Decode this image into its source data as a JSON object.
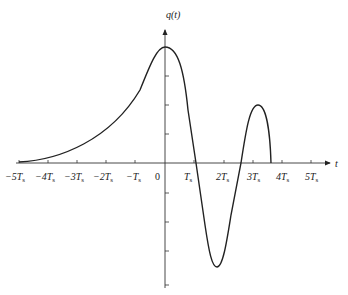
{
  "diagram": {
    "y_label": "q(t)",
    "x_label": "t",
    "x_ticks": [
      {
        "sign": "−",
        "coef": "5",
        "sym": "T",
        "sub": "s",
        "x": 19
      },
      {
        "sign": "−",
        "coef": "4",
        "sym": "T",
        "sub": "s",
        "x": 48
      },
      {
        "sign": "−",
        "coef": "3",
        "sym": "T",
        "sub": "s",
        "x": 77
      },
      {
        "sign": "−",
        "coef": "2",
        "sym": "T",
        "sub": "s",
        "x": 106
      },
      {
        "sign": "−",
        "coef": "",
        "sym": "T",
        "sub": "s",
        "x": 135
      },
      {
        "sign": "",
        "coef": "0",
        "sym": "",
        "sub": "",
        "x": 158
      },
      {
        "sign": "",
        "coef": "",
        "sym": "T",
        "sub": "s",
        "x": 194
      },
      {
        "sign": "",
        "coef": "2",
        "sym": "T",
        "sub": "s",
        "x": 224
      },
      {
        "sign": "",
        "coef": "3",
        "sym": "T",
        "sub": "s",
        "x": 253
      },
      {
        "sign": "",
        "coef": "4",
        "sym": "T",
        "sub": "s",
        "x": 282
      },
      {
        "sign": "",
        "coef": "5",
        "sym": "T",
        "sub": "s",
        "x": 311
      }
    ],
    "labels": {
      "m5": "−5T",
      "m4": "−4T",
      "m3": "−3T",
      "m2": "−2T",
      "m1": "−T",
      "zero": "0",
      "p1": "T",
      "p2": "2T",
      "p3": "3T",
      "p4": "4T",
      "p5": "5T",
      "sub": "s"
    }
  }
}
